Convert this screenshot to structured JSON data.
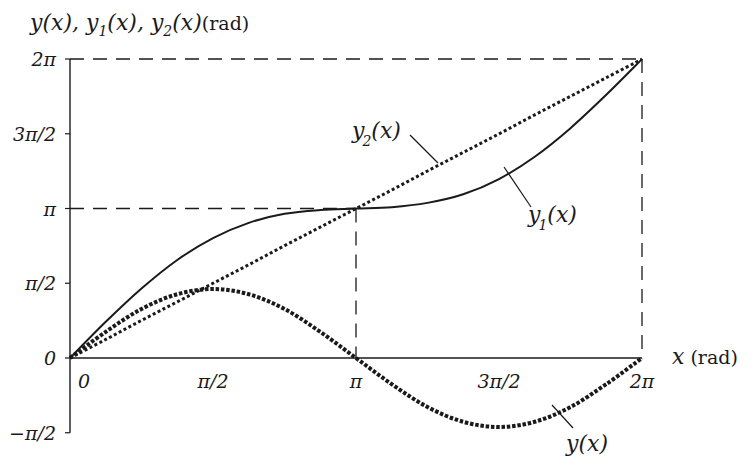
{
  "chart_data": {
    "type": "line",
    "title": "",
    "ylabel_parts": [
      "y(x), y",
      "1",
      "(x), y",
      "2",
      "(x)",
      "(rad)"
    ],
    "ylabel": "y(x), y1(x), y2(x) (rad)",
    "xlabel": "x (rad)",
    "xlabel_var": "x",
    "xlabel_unit": "(rad)",
    "xlim": [
      0,
      6.2832
    ],
    "ylim": [
      -1.5708,
      6.2832
    ],
    "x_ticks": [
      {
        "value": 0,
        "label": "0"
      },
      {
        "value": 1.5708,
        "label": "π/2"
      },
      {
        "value": 3.1416,
        "label": "π"
      },
      {
        "value": 4.7124,
        "label": "3π/2"
      },
      {
        "value": 6.2832,
        "label": "2π"
      }
    ],
    "y_ticks": [
      {
        "value": -1.5708,
        "label": "−π/2"
      },
      {
        "value": 0,
        "label": "0"
      },
      {
        "value": 1.5708,
        "label": "π/2"
      },
      {
        "value": 3.1416,
        "label": "π"
      },
      {
        "value": 4.7124,
        "label": "3π/2"
      },
      {
        "value": 6.2832,
        "label": "2π"
      }
    ],
    "grid": false,
    "guides": [
      "dashed line y=2π",
      "dashed line y=π from 0 to π",
      "dashed line x=π",
      "dashed line x=2π"
    ],
    "x": [
      0,
      0.3927,
      0.7854,
      1.1781,
      1.5708,
      1.9635,
      2.3562,
      2.7489,
      3.1416,
      3.5343,
      3.927,
      4.3197,
      4.7124,
      5.1051,
      5.4978,
      5.8905,
      6.2832
    ],
    "series": [
      {
        "name": "y(x)",
        "style": "dotted-heavy",
        "values": [
          0,
          0.55,
          1.03,
          1.34,
          1.45,
          1.34,
          1.03,
          0.55,
          0,
          -0.55,
          -1.03,
          -1.34,
          -1.45,
          -1.34,
          -1.03,
          -0.55,
          0
        ]
      },
      {
        "name": "y1(x)",
        "style": "solid",
        "values": [
          0,
          0.76,
          1.46,
          2.06,
          2.52,
          2.84,
          3.03,
          3.11,
          3.14,
          3.17,
          3.26,
          3.44,
          3.76,
          4.23,
          4.83,
          5.53,
          6.28
        ]
      },
      {
        "name": "y2(x)",
        "style": "dotted",
        "values": [
          0,
          0.39,
          0.79,
          1.18,
          1.57,
          1.96,
          2.36,
          2.75,
          3.14,
          3.53,
          3.93,
          4.32,
          4.71,
          5.11,
          5.5,
          5.89,
          6.28
        ]
      }
    ],
    "annotations": [
      {
        "text": "y2(x)",
        "target": "y2(x)",
        "position": "upper middle"
      },
      {
        "text": "y1(x)",
        "target": "y1(x)",
        "position": "right of π"
      },
      {
        "text": "y(x)",
        "target": "y(x)",
        "position": "below 3π/2"
      }
    ]
  },
  "labels": {
    "y_axis_main": "y(x), y",
    "y_axis_sub1": "1",
    "y_axis_mid": "(x), y",
    "y_axis_sub2": "2",
    "y_axis_end": "(x)",
    "y_axis_unit": "(rad)",
    "x_axis_var": "x",
    "x_axis_unit": "(rad)",
    "curve_y": "y(x)",
    "curve_y1_base": "y",
    "curve_y1_sub": "1",
    "curve_y1_arg": "(x)",
    "curve_y2_base": "y",
    "curve_y2_sub": "2",
    "curve_y2_arg": "(x)"
  }
}
